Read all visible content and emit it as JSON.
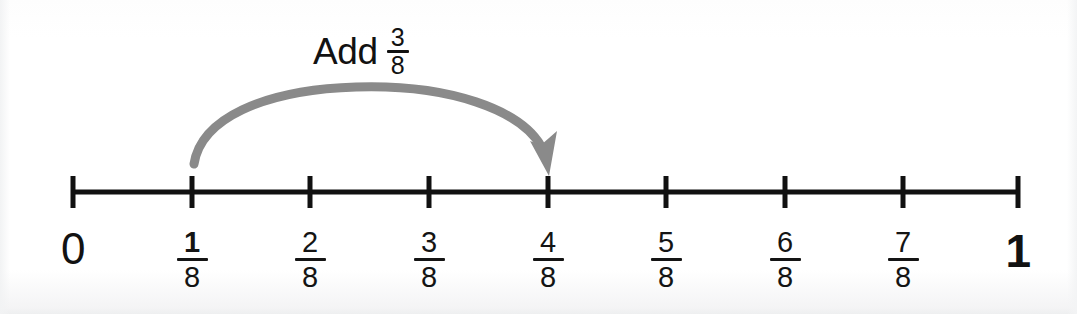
{
  "figure": {
    "type": "number-line",
    "title_text": "Add",
    "background_color": "#ffffff",
    "line_color": "#111111",
    "arrow_color": "#8a8a8a"
  },
  "caption": {
    "word": "Add",
    "fraction_numerator": "3",
    "fraction_denominator": "8",
    "fraction_text": "3/8"
  },
  "number_line": {
    "start_label": "0",
    "end_label": "1",
    "denominator": "8",
    "ticks": [
      {
        "label": "0",
        "kind": "whole",
        "numerator": "0",
        "denominator": "",
        "value": 0,
        "x": 73
      },
      {
        "label": "1/8",
        "kind": "fraction",
        "numerator": "1",
        "denominator": "8",
        "value": 0.125,
        "x": 192
      },
      {
        "label": "2/8",
        "kind": "fraction",
        "numerator": "2",
        "denominator": "8",
        "value": 0.25,
        "x": 310
      },
      {
        "label": "3/8",
        "kind": "fraction",
        "numerator": "3",
        "denominator": "8",
        "value": 0.375,
        "x": 429
      },
      {
        "label": "4/8",
        "kind": "fraction",
        "numerator": "4",
        "denominator": "8",
        "value": 0.5,
        "x": 548
      },
      {
        "label": "5/8",
        "kind": "fraction",
        "numerator": "5",
        "denominator": "8",
        "value": 0.625,
        "x": 666
      },
      {
        "label": "6/8",
        "kind": "fraction",
        "numerator": "6",
        "denominator": "8",
        "value": 0.75,
        "x": 785
      },
      {
        "label": "7/8",
        "kind": "fraction",
        "numerator": "7",
        "denominator": "8",
        "value": 0.875,
        "x": 903
      },
      {
        "label": "1",
        "kind": "whole",
        "numerator": "1",
        "denominator": "",
        "value": 1,
        "x": 1018
      }
    ]
  },
  "jump_arrow": {
    "from_label": "1/8",
    "from_value": 0.125,
    "to_label": "4/8",
    "to_value": 0.5,
    "amount_label": "3/8",
    "amount_value": 0.375,
    "color": "#8a8a8a",
    "direction": "right"
  }
}
